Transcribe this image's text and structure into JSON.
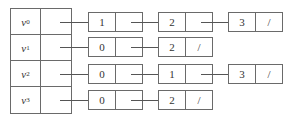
{
  "diagram": {
    "title": "",
    "type": "adjacency-list",
    "vertices": [
      {
        "label": "v",
        "sub": "0",
        "edges": [
          {
            "value": "1",
            "next": ""
          },
          {
            "value": "2",
            "next": ""
          },
          {
            "value": "3",
            "next": "/"
          }
        ]
      },
      {
        "label": "v",
        "sub": "1",
        "edges": [
          {
            "value": "0",
            "next": ""
          },
          {
            "value": "2",
            "next": "/"
          }
        ]
      },
      {
        "label": "v",
        "sub": "2",
        "edges": [
          {
            "value": "0",
            "next": ""
          },
          {
            "value": "1",
            "next": ""
          },
          {
            "value": "3",
            "next": "/"
          }
        ]
      },
      {
        "label": "v",
        "sub": "3",
        "edges": [
          {
            "value": "0",
            "next": ""
          },
          {
            "value": "2",
            "next": "/"
          }
        ]
      }
    ],
    "null_symbol": "/",
    "colors": {
      "line": "#6a6a6a",
      "text": "#333333",
      "background": "#ffffff"
    }
  }
}
